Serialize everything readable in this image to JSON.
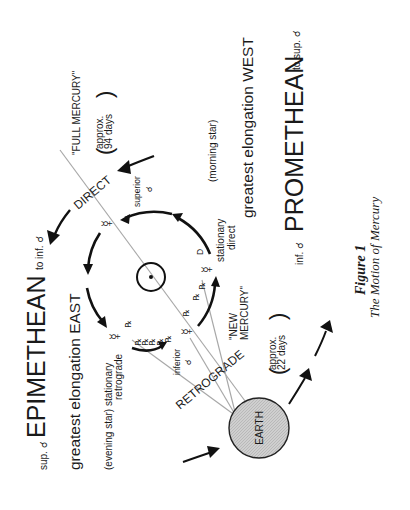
{
  "figure": {
    "title": "Figure 1",
    "subtitle": "The Motion of Mercury"
  },
  "labels": {
    "full_mercury": "\"FULL MERCURY\"",
    "approx_94_line1": "approx.",
    "approx_94_line2": "94 days",
    "direct": "DIRECT",
    "superior": "superior",
    "conj_symbol": "☌",
    "to_inf_conj": "to inf.",
    "epimethean": "EPIMETHEAN",
    "sup_conj": "sup.",
    "greatest_elongation_east": "greatest elongation EAST",
    "evening_star": "(evening star)",
    "stationary_retrograde_line1": "stationary",
    "stationary_retrograde_line2": "retrograde",
    "inferior": "inferior",
    "retrograde": "RETROGRADE",
    "earth": "EARTH",
    "approx_22_line1": "approx.",
    "approx_22_line2": "22 days",
    "new_mercury_line1": "\"NEW",
    "new_mercury_line2": "MERCURY\"",
    "stationary_direct_line1": "stationary",
    "stationary_direct_line2": "direct",
    "direct_marker": "D",
    "retro_marker": "℞",
    "morning_star": "(morning star)",
    "greatest_elongation_west": "greatest elongation WEST",
    "inf_conj": "inf.",
    "promethean": "PROMETHEAN",
    "to_sup_conj": "to sup.",
    "mercury_symbol": "☿",
    "sun_symbol": "☉"
  },
  "colors": {
    "ink": "#1a1a1a",
    "sightline": "#a8a8a8",
    "earth_fill": "#c8c8c8"
  }
}
